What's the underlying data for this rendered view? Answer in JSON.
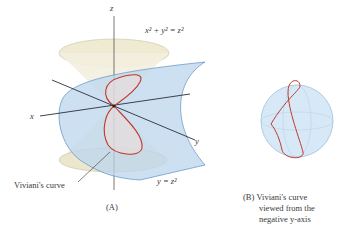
{
  "figure_a": {
    "axis_labels": {
      "x": "x",
      "y": "y",
      "z": "z"
    },
    "cone_equation": "x² + y² = z²",
    "cylinder_equation": "y = z²",
    "curve_label": "Viviani's curve",
    "caption": "(A)"
  },
  "figure_b": {
    "caption_tag": "(B)",
    "caption_line1": "Viviani's curve",
    "caption_line2": "viewed from the",
    "caption_line3": "negative y-axis"
  },
  "colors": {
    "cone_fill": "#efebd3",
    "surface_fill": "#bcd6ee",
    "surface_edge": "#5b8fc4",
    "curve": "#c0392b",
    "axis": "#2a2f3a",
    "sphere_fill": "#d7e8f6"
  }
}
